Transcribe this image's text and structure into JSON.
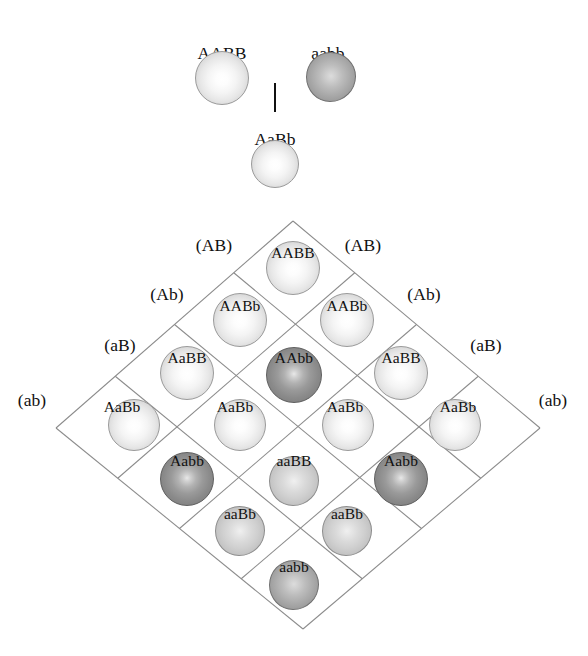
{
  "figure": {
    "kind": "punnett-square",
    "grid_size": 4,
    "rotation_deg": 45,
    "background_color": "#ffffff",
    "grid_line_color": "#8b8b8b",
    "text_color": "#111111"
  },
  "parents": {
    "cross_symbol": "|",
    "items": [
      {
        "id": "parent-aabb-dominant",
        "label": "AABB",
        "tone": "light",
        "x": 222,
        "y": 78,
        "r": 27,
        "label_x": 222,
        "label_y": 45
      },
      {
        "id": "parent-aabb-recessive",
        "label": "aabb",
        "tone": "middark",
        "x": 331,
        "y": 77,
        "r": 25,
        "label_x": 328,
        "label_y": 45,
        "blob": true
      },
      {
        "id": "parent-f1-aabb",
        "label": "AaBb",
        "tone": "light",
        "x": 275,
        "y": 164,
        "r": 24,
        "label_x": 275,
        "label_y": 131
      }
    ],
    "cross_line": {
      "x": 275,
      "y_top": 83,
      "y_bottom": 112
    }
  },
  "gametes": {
    "left": [
      {
        "label": "(AB)",
        "x": 214,
        "y": 237
      },
      {
        "label": "(Ab)",
        "x": 167,
        "y": 286
      },
      {
        "label": "(aB)",
        "x": 120,
        "y": 337
      },
      {
        "label": "(ab)",
        "x": 32,
        "y": 392
      }
    ],
    "right": [
      {
        "label": "(AB)",
        "x": 363,
        "y": 237
      },
      {
        "label": "(Ab)",
        "x": 424,
        "y": 286
      },
      {
        "label": "(aB)",
        "x": 486,
        "y": 337
      },
      {
        "label": "(ab)",
        "x": 553,
        "y": 392
      }
    ]
  },
  "cells": [
    {
      "row": 0,
      "col": 0,
      "label": "AABB",
      "tone": "light",
      "cx": 293,
      "cy": 268,
      "r": 27,
      "label_x": 293,
      "label_y": 245
    },
    {
      "row": 0,
      "col": 1,
      "label": "AABb",
      "tone": "light",
      "cx": 240,
      "cy": 320,
      "r": 27,
      "label_x": 240,
      "label_y": 298
    },
    {
      "row": 1,
      "col": 0,
      "label": "AABb",
      "tone": "light",
      "cx": 347,
      "cy": 320,
      "r": 27,
      "label_x": 347,
      "label_y": 298
    },
    {
      "row": 0,
      "col": 2,
      "label": "AaBB",
      "tone": "light",
      "cx": 187,
      "cy": 373,
      "r": 27,
      "label_x": 187,
      "label_y": 350
    },
    {
      "row": 1,
      "col": 1,
      "label": "AAbb",
      "tone": "dark",
      "cx": 294,
      "cy": 375,
      "r": 28,
      "label_x": 294,
      "label_y": 350
    },
    {
      "row": 2,
      "col": 0,
      "label": "AaBB",
      "tone": "light",
      "cx": 401,
      "cy": 373,
      "r": 27,
      "label_x": 401,
      "label_y": 350
    },
    {
      "row": 0,
      "col": 3,
      "label": "AaBb",
      "tone": "light",
      "cx": 134,
      "cy": 425,
      "r": 26,
      "label_x": 122,
      "label_y": 399
    },
    {
      "row": 1,
      "col": 2,
      "label": "AaBb",
      "tone": "light",
      "cx": 240,
      "cy": 425,
      "r": 26,
      "label_x": 235,
      "label_y": 399
    },
    {
      "row": 2,
      "col": 1,
      "label": "AaBb",
      "tone": "light",
      "cx": 348,
      "cy": 425,
      "r": 26,
      "label_x": 345,
      "label_y": 399
    },
    {
      "row": 3,
      "col": 0,
      "label": "AaBb",
      "tone": "light",
      "cx": 455,
      "cy": 425,
      "r": 26,
      "label_x": 458,
      "label_y": 399
    },
    {
      "row": 1,
      "col": 3,
      "label": "Aabb",
      "tone": "dark",
      "cx": 187,
      "cy": 479,
      "r": 27,
      "label_x": 187,
      "label_y": 453
    },
    {
      "row": 2,
      "col": 2,
      "label": "aaBB",
      "tone": "mid",
      "cx": 294,
      "cy": 481,
      "r": 25,
      "label_x": 294,
      "label_y": 453,
      "blob": true
    },
    {
      "row": 3,
      "col": 1,
      "label": "Aabb",
      "tone": "dark",
      "cx": 401,
      "cy": 479,
      "r": 27,
      "label_x": 401,
      "label_y": 453
    },
    {
      "row": 2,
      "col": 3,
      "label": "aaBb",
      "tone": "mid",
      "cx": 240,
      "cy": 531,
      "r": 25,
      "label_x": 240,
      "label_y": 506,
      "blob": true
    },
    {
      "row": 3,
      "col": 2,
      "label": "aaBb",
      "tone": "mid",
      "cx": 347,
      "cy": 531,
      "r": 25,
      "label_x": 347,
      "label_y": 506,
      "blob": true
    },
    {
      "row": 3,
      "col": 3,
      "label": "aabb",
      "tone": "middark",
      "cx": 294,
      "cy": 585,
      "r": 25,
      "label_x": 294,
      "label_y": 559,
      "blob": true
    }
  ],
  "grid_geometry": {
    "apex_top": {
      "x": 293,
      "y": 221
    },
    "apex_left": {
      "x": 56,
      "y": 428
    },
    "apex_right": {
      "x": 540,
      "y": 428
    },
    "apex_bottom": {
      "x": 303,
      "y": 629
    }
  }
}
